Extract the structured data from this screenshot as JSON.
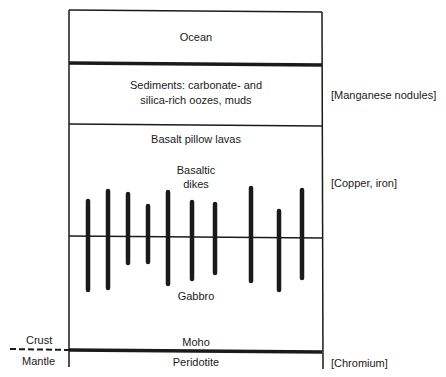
{
  "diagram": {
    "layers": [
      {
        "id": "ocean",
        "label": "Ocean"
      },
      {
        "id": "sediments",
        "label_line1": "Sediments: carbonate- and",
        "label_line2": "silica-rich oozes, muds"
      },
      {
        "id": "pillow-lavas",
        "label": "Basalt pillow lavas"
      },
      {
        "id": "dikes",
        "label_line1": "Basaltic",
        "label_line2": "dikes"
      },
      {
        "id": "gabbro",
        "label": "Gabbro"
      },
      {
        "id": "moho",
        "label": "Moho"
      },
      {
        "id": "peridotite",
        "label": "Peridotite"
      }
    ],
    "resources": {
      "manganese": "[Manganese nodules]",
      "copper_iron": "[Copper, iron]",
      "chromium": "[Chromium]"
    },
    "boundary": {
      "crust": "Crust",
      "mantle": "Mantle"
    },
    "dike_count": 10,
    "colors": {
      "ink": "#1a1a1a",
      "background": "#ffffff"
    }
  }
}
